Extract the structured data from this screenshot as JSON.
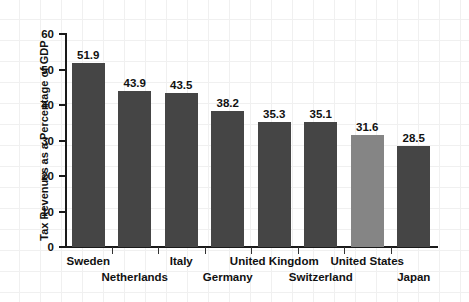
{
  "chart_data": {
    "type": "bar",
    "title": "",
    "subtitle": "",
    "xlabel": "",
    "ylabel": "Tax Revenues as a Percentage of GDP",
    "ylim": [
      0,
      60
    ],
    "ytick_step": 10,
    "yticks": [
      "60",
      "50",
      "40",
      "30",
      "20",
      "10",
      "0"
    ],
    "grid": true,
    "legend": "none",
    "categories": [
      "Sweden",
      "Netherlands",
      "Italy",
      "Germany",
      "United Kingdom",
      "Switzerland",
      "United States",
      "Japan"
    ],
    "values": [
      51.9,
      43.9,
      43.5,
      38.2,
      35.3,
      35.1,
      31.6,
      28.5
    ],
    "value_labels": [
      "51.9",
      "43.9",
      "43.5",
      "38.2",
      "35.3",
      "35.1",
      "31.6",
      "28.5"
    ],
    "bar_colors": [
      "#454545",
      "#454545",
      "#454545",
      "#454545",
      "#454545",
      "#454545",
      "#858585",
      "#454545"
    ],
    "highlighted_category": "United States",
    "label_rows": [
      0,
      1,
      0,
      1,
      0,
      1,
      0,
      1
    ],
    "colors": {
      "bar_default": "#454545",
      "bar_highlight": "#858585",
      "axis": "#1a1a1a",
      "text": "#111111",
      "grid": "#f0f0f0",
      "background": "#ffffff"
    }
  }
}
